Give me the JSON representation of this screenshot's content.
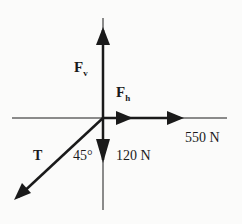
{
  "diagram": {
    "type": "free-body force diagram",
    "colors": {
      "line": "#1a1a1a",
      "background": "#fbfbfa"
    },
    "forces": [
      {
        "id": "Fv",
        "label_main": "F",
        "label_sub": "v",
        "direction": "up"
      },
      {
        "id": "Fh",
        "label_main": "F",
        "label_sub": "h",
        "direction": "right"
      },
      {
        "id": "550N",
        "label": "550 N",
        "direction": "right"
      },
      {
        "id": "120N",
        "label": "120 N",
        "direction": "down"
      },
      {
        "id": "T",
        "label": "T",
        "direction": "down-left"
      }
    ],
    "angle_label": "45°"
  }
}
